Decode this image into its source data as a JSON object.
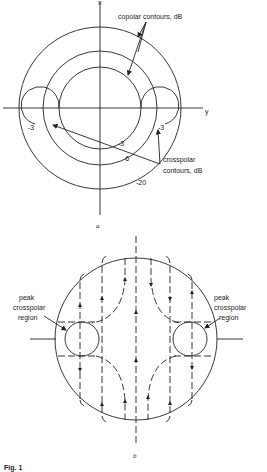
{
  "figure": {
    "caption": "Fig. 1",
    "panel_a": {
      "label": "a",
      "axis_x_label": "x",
      "axis_y_label": "y",
      "copolar_label": "copolar contours, dB",
      "crosspolar_label_line1": "crosspolar",
      "crosspolar_label_line2": "contours, dB",
      "copolar_levels": [
        "-3",
        "-6",
        "-20"
      ],
      "crosspolar_levels": [
        "-3",
        "-3"
      ]
    },
    "panel_b": {
      "label": "b",
      "left_annotation": [
        "peak",
        "crosspolar",
        "region"
      ],
      "right_annotation": [
        "peak",
        "crosspolar",
        "region"
      ]
    }
  }
}
